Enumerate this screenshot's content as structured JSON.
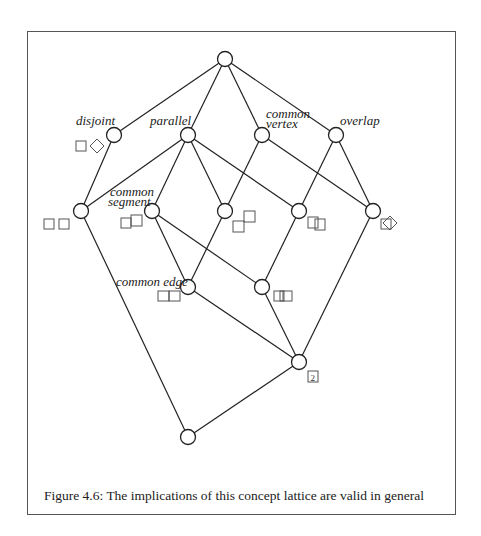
{
  "figure": {
    "caption": "Figure 4.6: The implications of this concept lattice are valid in general"
  },
  "labels": {
    "disjoint": "disjoint",
    "parallel": "parallel",
    "common_vertex_1": "common",
    "common_vertex_2": "vertex",
    "overlap": "overlap",
    "common_segment_1": "common",
    "common_segment_2": "segment",
    "common_edge": "common edge",
    "count_badge": "2"
  },
  "lattice": {
    "nodes": [
      {
        "id": "top",
        "x": 225,
        "y": 59
      },
      {
        "id": "disjoint",
        "x": 114,
        "y": 135
      },
      {
        "id": "parallel",
        "x": 188,
        "y": 135
      },
      {
        "id": "common-vertex",
        "x": 262,
        "y": 135
      },
      {
        "id": "overlap",
        "x": 336,
        "y": 135
      },
      {
        "id": "n3a",
        "x": 81,
        "y": 211
      },
      {
        "id": "common-segment",
        "x": 152,
        "y": 211
      },
      {
        "id": "n3c",
        "x": 225,
        "y": 211
      },
      {
        "id": "n3d",
        "x": 299,
        "y": 211
      },
      {
        "id": "n3e",
        "x": 373,
        "y": 211
      },
      {
        "id": "common-edge",
        "x": 188,
        "y": 287
      },
      {
        "id": "n4b",
        "x": 262,
        "y": 287
      },
      {
        "id": "n5",
        "x": 299,
        "y": 362
      },
      {
        "id": "bottom",
        "x": 188,
        "y": 437
      }
    ],
    "edges": [
      [
        "top",
        "disjoint"
      ],
      [
        "top",
        "parallel"
      ],
      [
        "top",
        "common-vertex"
      ],
      [
        "top",
        "overlap"
      ],
      [
        "disjoint",
        "n3a"
      ],
      [
        "parallel",
        "n3a"
      ],
      [
        "parallel",
        "common-segment"
      ],
      [
        "parallel",
        "n3c"
      ],
      [
        "parallel",
        "n3d"
      ],
      [
        "common-vertex",
        "n3c"
      ],
      [
        "common-vertex",
        "n3e"
      ],
      [
        "overlap",
        "n3d"
      ],
      [
        "overlap",
        "n3e"
      ],
      [
        "common-segment",
        "common-edge"
      ],
      [
        "common-segment",
        "n4b"
      ],
      [
        "n3c",
        "common-edge"
      ],
      [
        "n3d",
        "n4b"
      ],
      [
        "n3a",
        "bottom"
      ],
      [
        "n3e",
        "n5"
      ],
      [
        "common-edge",
        "n5"
      ],
      [
        "n4b",
        "n5"
      ],
      [
        "n5",
        "bottom"
      ]
    ]
  }
}
